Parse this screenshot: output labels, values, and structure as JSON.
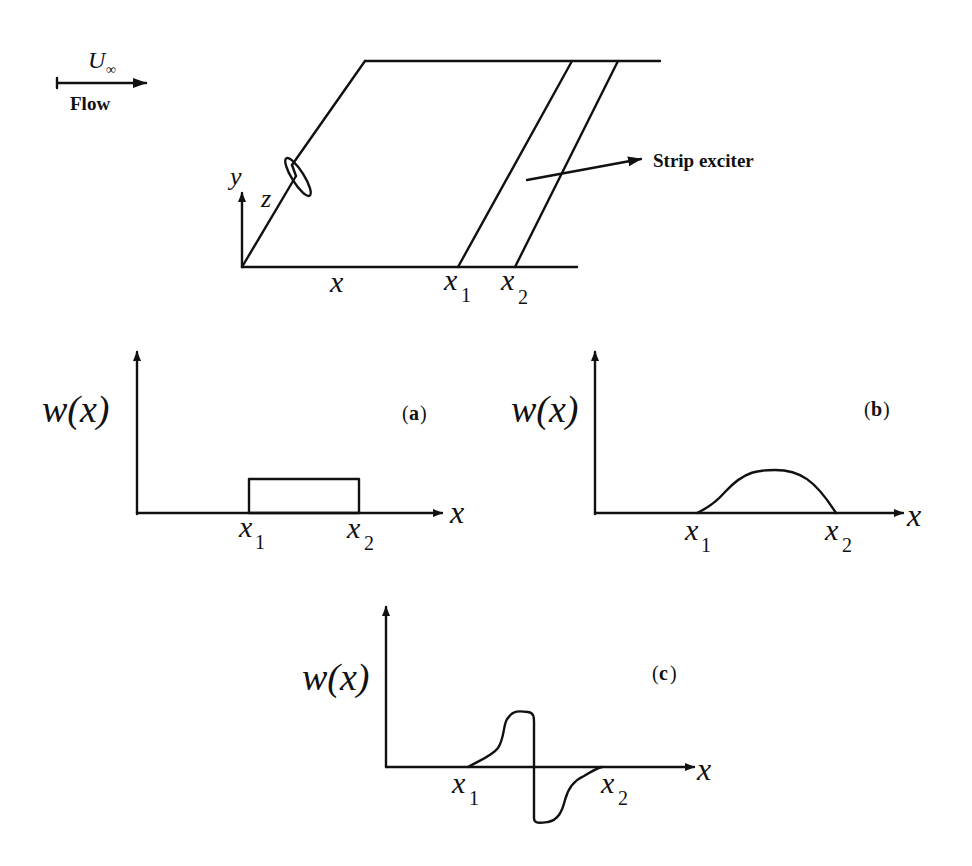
{
  "flow": {
    "velocity_label": "U",
    "velocity_subscript": "∞",
    "label": "Flow"
  },
  "plate": {
    "axis_y": "y",
    "axis_z": "z",
    "axis_x": "x",
    "x1_base": "x",
    "x1_sub": "1",
    "x2_base": "x",
    "x2_sub": "2",
    "exciter_label": "Strip exciter"
  },
  "panels": [
    {
      "id": "a",
      "tag": "(a)",
      "tag_letter": "a",
      "ylabel": "w(x)",
      "xlabel": "x",
      "x1_base": "x",
      "x1_sub": "1",
      "x2_base": "x",
      "x2_sub": "2",
      "shape": "rectangular"
    },
    {
      "id": "b",
      "tag": "(b)",
      "tag_letter": "b",
      "ylabel": "w(x)",
      "xlabel": "x",
      "x1_base": "x",
      "x1_sub": "1",
      "x2_base": "x",
      "x2_sub": "2",
      "shape": "half-sine"
    },
    {
      "id": "c",
      "tag": "(c)",
      "tag_letter": "c",
      "ylabel": "w(x)",
      "xlabel": "x",
      "x1_base": "x",
      "x1_sub": "1",
      "x2_base": "x",
      "x2_sub": "2",
      "shape": "antisymmetric"
    }
  ],
  "colors": {
    "ink": "#111111",
    "background": "#ffffff"
  }
}
